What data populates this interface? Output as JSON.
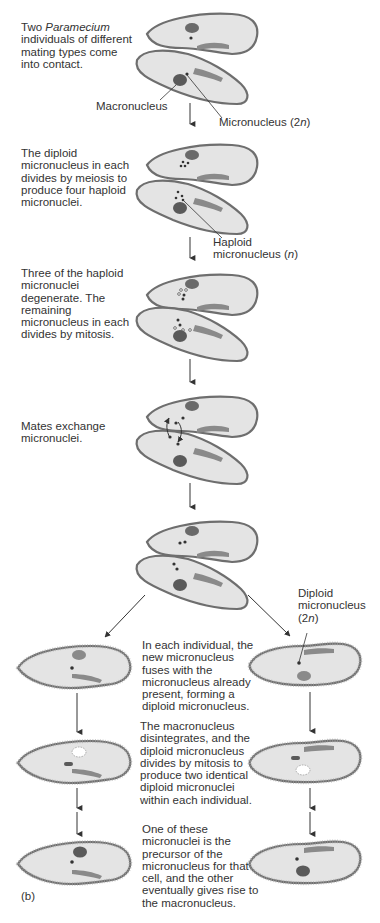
{
  "figure": {
    "panel_label": "(b)",
    "colors": {
      "cell_fill": "#e4e4e4",
      "cell_outline": "#6e6e6e",
      "cilia": "#9a9a9a",
      "nucleus": "#5a5a5a",
      "macronucleus": "#7a7a7a",
      "arrow": "#333333",
      "text": "#333333"
    }
  },
  "steps": [
    {
      "id": 1,
      "text_before_italic": "Two ",
      "italic": "Paramecium",
      "text_after_italic": " individuals of different mating types come into contact.",
      "lines": [
        "Two Paramecium",
        "individuals of different",
        "mating types come",
        "into contact."
      ]
    },
    {
      "id": 2,
      "lines": [
        "The diploid",
        "micronucleus in each",
        "divides by meiosis to",
        "produce four haploid",
        "micronuclei."
      ]
    },
    {
      "id": 3,
      "lines": [
        "Three of the haploid",
        "micronuclei",
        "degenerate. The",
        "remaining",
        "micronucleus in each",
        "divides by mitosis."
      ]
    },
    {
      "id": 4,
      "lines": [
        "Mates exchange",
        "micronuclei."
      ]
    },
    {
      "id": 5,
      "lines": [
        "In each individual, the",
        "new micronucleus",
        "fuses with the",
        "micronucleus already",
        "present, forming a",
        "diploid micronucleus."
      ]
    },
    {
      "id": 6,
      "lines": [
        "The macronucleus",
        "disintegrates, and the",
        "diploid micronucleus",
        "divides by mitosis to",
        "produce two identical",
        "diploid micronuclei",
        "within each individual."
      ]
    },
    {
      "id": 7,
      "lines": [
        "One of these",
        "micronuclei is the",
        "precursor of the",
        "micronucleus for that",
        "cell, and the other",
        "eventually gives rise to",
        "the macronucleus."
      ]
    }
  ],
  "labels": {
    "macronucleus": "Macronucleus",
    "micronucleus_2n_prefix": "Micronucleus (2",
    "micronucleus_2n_n": "n",
    "micronucleus_2n_suffix": ")",
    "haploid_line1": "Haploid",
    "haploid_line2_prefix": "micronucleus (",
    "haploid_line2_n": "n",
    "haploid_line2_suffix": ")",
    "diploid_line1": "Diploid",
    "diploid_line2": "micronucleus",
    "diploid_line3_prefix": "(2",
    "diploid_line3_n": "n",
    "diploid_line3_suffix": ")"
  }
}
